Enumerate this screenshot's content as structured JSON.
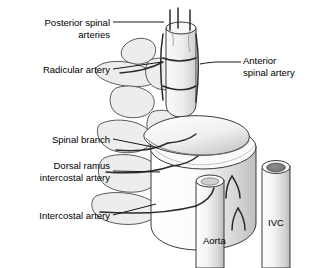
{
  "figure": {
    "type": "anatomical-illustration",
    "background_color": "#ffffff",
    "line_color": "#1a1a1a",
    "bone_fill": "#eaeaea",
    "vessel_fill": "#f2f2f2",
    "shadow_fill": "#bdbdbd",
    "width": 311,
    "height": 268
  },
  "labels": {
    "posterior_spinal": {
      "line1": "Posterior spinal",
      "line2": "arteries"
    },
    "radicular": {
      "line1": "Radicular artery"
    },
    "spinal_branch": {
      "line1": "Spinal branch"
    },
    "dorsal_ramus": {
      "line1": "Dorsal ramus",
      "line2": "intercostal artery"
    },
    "intercostal": {
      "line1": "Intercostal artery"
    },
    "anterior_spinal": {
      "line1": "Anterior",
      "line2": "spinal artery"
    },
    "aorta": {
      "text": "Aorta"
    },
    "ivc": {
      "text": "IVC"
    }
  },
  "structures": [
    {
      "name": "spinal-cord",
      "description": "vertical spinal cord at top center"
    },
    {
      "name": "vertebral-body",
      "description": "large cylindrical vertebral body center right"
    },
    {
      "name": "vertebral-arch-upper",
      "description": "upper vertebral arch and transverse process"
    },
    {
      "name": "vertebral-arch-lower",
      "description": "lower vertebral arch and transverse process"
    },
    {
      "name": "aorta-vessel",
      "description": "vertical tube anterior left"
    },
    {
      "name": "ivc-vessel",
      "description": "vertical tube anterior right, dark lumen"
    },
    {
      "name": "intervertebral-disc",
      "description": "oval disc on top of vertebral body"
    }
  ]
}
